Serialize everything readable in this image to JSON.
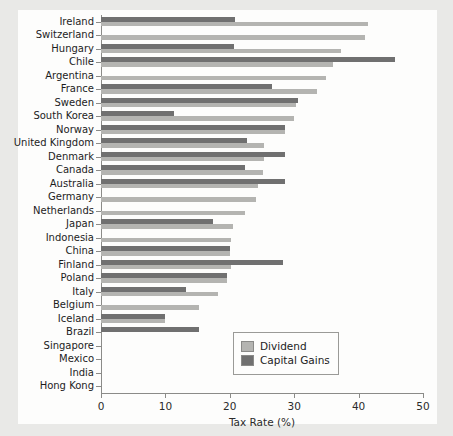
{
  "chart_data": {
    "type": "bar",
    "orientation": "horizontal",
    "title": "",
    "xlabel": "Tax Rate (%)",
    "ylabel": "",
    "xlim": [
      0,
      50
    ],
    "xticks": [
      0,
      10,
      20,
      30,
      40,
      50
    ],
    "grid": false,
    "legend_position": "lower right",
    "legend": [
      "Dividend",
      "Capital Gains"
    ],
    "colors": {
      "dividend": "#b4b4b1",
      "capital_gains": "#707070",
      "background": "#e9e9e7",
      "panel": "#fdfdfc",
      "axis": "#8b8b88"
    },
    "categories": [
      "Ireland",
      "Switzerland",
      "Hungary",
      "Chile",
      "Argentina",
      "France",
      "Sweden",
      "South Korea",
      "Norway",
      "United Kingdom",
      "Denmark",
      "Canada",
      "Australia",
      "Germany",
      "Netherlands",
      "Japan",
      "Indonesia",
      "China",
      "Finland",
      "Poland",
      "Italy",
      "Belgium",
      "Iceland",
      "Brazil",
      "Singapore",
      "Mexico",
      "India",
      "Hong Kong"
    ],
    "series": [
      {
        "name": "Dividend",
        "values": [
          41.5,
          41.0,
          37.3,
          36.0,
          35.0,
          33.5,
          30.3,
          30.0,
          28.6,
          25.3,
          25.3,
          25.2,
          24.4,
          24.0,
          22.4,
          20.5,
          20.2,
          20.1,
          20.2,
          19.6,
          18.2,
          15.2,
          10.0,
          0.0,
          0.0,
          0.0,
          0.0,
          0.0
        ]
      },
      {
        "name": "Capital Gains",
        "values": [
          20.8,
          0.0,
          20.7,
          45.6,
          0.0,
          26.6,
          30.6,
          11.3,
          28.6,
          22.7,
          28.6,
          22.4,
          28.5,
          0.0,
          0.0,
          17.4,
          0.0,
          20.1,
          28.3,
          19.6,
          13.2,
          0.0,
          10.0,
          15.2,
          0.0,
          0.0,
          0.0,
          0.0
        ]
      }
    ]
  }
}
